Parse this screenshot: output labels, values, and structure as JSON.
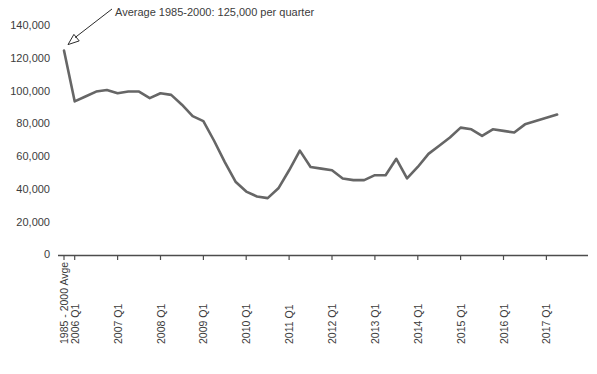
{
  "chart_data": {
    "type": "line",
    "title": "",
    "subtitle": "",
    "xlabel": "",
    "ylabel": "",
    "ylim": [
      0,
      140000
    ],
    "ytick_values": [
      0,
      20000,
      40000,
      60000,
      80000,
      100000,
      120000,
      140000
    ],
    "ytick_labels": [
      "0",
      "20,000",
      "40,000",
      "60,000",
      "80,000",
      "100,000",
      "120,000",
      "140,000"
    ],
    "grid": false,
    "legend": false,
    "legend_position": "none",
    "line_color": "#666666",
    "axis_color": "#4d4d4d",
    "xtick_labels": [
      "1985 - 2000 Avge",
      "2006 Q1",
      "2007 Q1",
      "2008 Q1",
      "2009 Q1",
      "2010 Q1",
      "2011 Q1",
      "2012 Q1",
      "2013 Q1",
      "2014 Q1",
      "2015 Q1",
      "2016 Q1",
      "2017 Q1"
    ],
    "xtick_index": [
      0,
      1,
      5,
      9,
      13,
      17,
      21,
      25,
      29,
      33,
      37,
      41,
      45
    ],
    "categories": [
      "1985 - 2000 Avge",
      "2006 Q1",
      "2006 Q2",
      "2006 Q3",
      "2006 Q4",
      "2007 Q1",
      "2007 Q2",
      "2007 Q3",
      "2007 Q4",
      "2008 Q1",
      "2008 Q2",
      "2008 Q3",
      "2008 Q4",
      "2009 Q1",
      "2009 Q2",
      "2009 Q3",
      "2009 Q4",
      "2010 Q1",
      "2010 Q2",
      "2010 Q3",
      "2010 Q4",
      "2011 Q1",
      "2011 Q2",
      "2011 Q3",
      "2011 Q4",
      "2012 Q1",
      "2012 Q2",
      "2012 Q3",
      "2012 Q4",
      "2013 Q1",
      "2013 Q2",
      "2013 Q3",
      "2013 Q4",
      "2014 Q1",
      "2014 Q2",
      "2014 Q3",
      "2014 Q4",
      "2015 Q1",
      "2015 Q2",
      "2015 Q3",
      "2015 Q4",
      "2016 Q1",
      "2016 Q2",
      "2016 Q3",
      "2016 Q4",
      "2017 Q1",
      "2017 Q2"
    ],
    "values": [
      125000,
      94000,
      97000,
      100000,
      101000,
      99000,
      100000,
      100000,
      96000,
      99000,
      98000,
      92000,
      85000,
      82000,
      70000,
      57000,
      45000,
      39000,
      36000,
      35000,
      41000,
      52000,
      64000,
      54000,
      53000,
      52000,
      47000,
      46000,
      46000,
      49000,
      49000,
      59000,
      47000,
      54000,
      62000,
      67000,
      72000,
      78000,
      77000,
      73000,
      77000,
      76000,
      75000,
      80000,
      82000,
      84000,
      86000
    ],
    "annotation": {
      "text": "Average 1985-2000: 125,000 per quarter",
      "target_value": 125000,
      "target_category": "1985 - 2000 Avge"
    }
  }
}
